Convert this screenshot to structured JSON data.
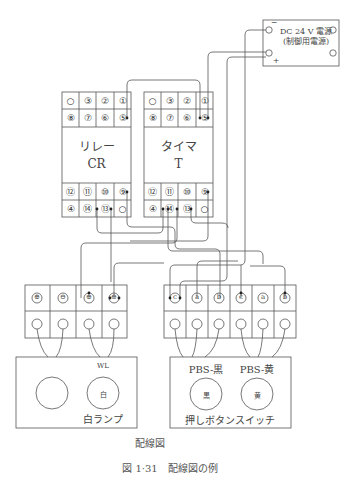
{
  "power_supply": {
    "title": "DC 24 V 電源",
    "subtitle": "(制御用電源)",
    "minus": "−",
    "plus": "+"
  },
  "relay": {
    "name": "リレー",
    "code": "CR",
    "top_rows": [
      [
        "○",
        "③",
        "②",
        "①"
      ],
      [
        "⑧",
        "⑦",
        "⑥",
        "⑤"
      ]
    ],
    "bottom_rows": [
      [
        "⑫",
        "⑪",
        "⑩",
        "⑨"
      ],
      [
        "④",
        "⑭",
        "⑬",
        "○"
      ]
    ]
  },
  "timer": {
    "name": "タイマ",
    "code": "T",
    "top_rows": [
      [
        "○",
        "③",
        "②",
        "①"
      ],
      [
        "⑧",
        "⑦",
        "⑥",
        "⑤"
      ]
    ],
    "bottom_rows": [
      [
        "⑫",
        "⑪",
        "⑩",
        "⑨"
      ],
      [
        "④",
        "⑭",
        "⑬",
        "○"
      ]
    ]
  },
  "lamp_terminals": {
    "top": [
      "⊕",
      "⊖",
      "⊕",
      "⊖"
    ]
  },
  "pbs_terminals": {
    "top": [
      "c",
      "a",
      "b",
      "c",
      "a",
      "b"
    ]
  },
  "lamp_panel": {
    "tag": "WL",
    "lamp_text": "白",
    "label": "白ランプ"
  },
  "pbs_panel": {
    "black_tag": "PBS-黒",
    "yellow_tag": "PBS-黄",
    "black_text": "黒",
    "yellow_text": "黄",
    "label": "押しボタンスイッチ"
  },
  "captions": {
    "diagram": "配線図",
    "figure": "図 1·31　配線図の例"
  }
}
